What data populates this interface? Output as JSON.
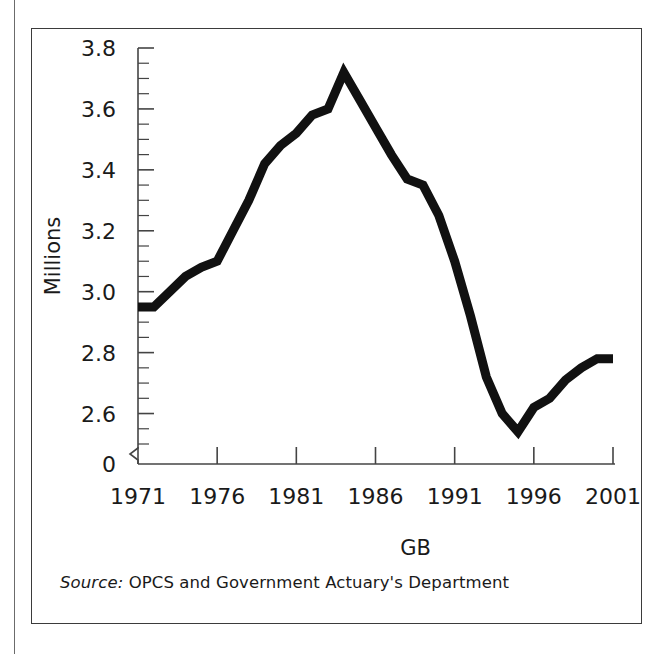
{
  "figure": {
    "source_prefix": "Source:",
    "source_text": "OPCS and Government Actuary's Department"
  },
  "colors": {
    "line": "#111111",
    "axis": "#444444",
    "text": "#1a1a1a",
    "frame": "#3b3b3b",
    "background": "#ffffff"
  },
  "chart_data": {
    "type": "line",
    "title": "",
    "subtitle": "",
    "xlabel": "GB",
    "ylabel": "Millions",
    "grid": false,
    "legend": null,
    "axis_break": "y-axis broken between 0 and 2.5",
    "xlim": [
      1971,
      2001
    ],
    "ylim": [
      2.5,
      3.8
    ],
    "ytick_labels": [
      "3.8",
      "3.6",
      "3.4",
      "3.2",
      "3.0",
      "2.8",
      "2.6",
      "0"
    ],
    "ytick_values": [
      3.8,
      3.6,
      3.4,
      3.2,
      3.0,
      2.8,
      2.6,
      0
    ],
    "ytick_minor_step": 0.05,
    "xtick_labels": [
      "1971",
      "1976",
      "1981",
      "1986",
      "1991",
      "1996",
      "2001"
    ],
    "xtick_values": [
      1971,
      1976,
      1981,
      1986,
      1991,
      1996,
      2001
    ],
    "series": [
      {
        "name": "GB",
        "x": [
          1971,
          1972,
          1973,
          1974,
          1975,
          1976,
          1977,
          1978,
          1979,
          1980,
          1981,
          1982,
          1983,
          1984,
          1985,
          1986,
          1987,
          1988,
          1989,
          1990,
          1991,
          1992,
          1993,
          1994,
          1995,
          1996,
          1997,
          1998,
          1999,
          2000,
          2001
        ],
        "values": [
          2.95,
          2.95,
          3.0,
          3.05,
          3.08,
          3.1,
          3.2,
          3.3,
          3.42,
          3.48,
          3.52,
          3.58,
          3.6,
          3.72,
          3.63,
          3.54,
          3.45,
          3.37,
          3.35,
          3.25,
          3.1,
          2.92,
          2.72,
          2.6,
          2.54,
          2.62,
          2.65,
          2.71,
          2.75,
          2.78,
          2.78
        ]
      }
    ]
  }
}
